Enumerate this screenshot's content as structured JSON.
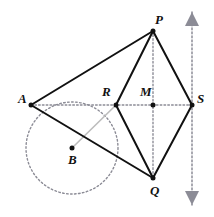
{
  "figure": {
    "kind": "geometry-diagram",
    "width": 214,
    "height": 217,
    "background": "#ffffff",
    "colors": {
      "stroke_solid": "#111111",
      "stroke_dotted": "#8c8c96",
      "stroke_gray": "#bdbdbd",
      "point_fill": "#111111",
      "arrow_fill": "#8c8c96",
      "label_color": "#111111"
    },
    "points": [
      {
        "id": "A",
        "label": "A",
        "x": 31,
        "y": 105,
        "label_dx": -13,
        "label_dy": -13,
        "dot": true
      },
      {
        "id": "R",
        "label": "R",
        "x": 116,
        "y": 105,
        "label_dx": -14,
        "label_dy": -20,
        "dot": true
      },
      {
        "id": "M",
        "label": "M",
        "x": 153,
        "y": 105,
        "label_dx": -13,
        "label_dy": -20,
        "dot": true
      },
      {
        "id": "S",
        "label": "S",
        "x": 192,
        "y": 105,
        "label_dx": 5,
        "label_dy": -13,
        "dot": true
      },
      {
        "id": "P",
        "label": "P",
        "x": 153,
        "y": 31,
        "label_dx": 2,
        "label_dy": -18,
        "dot": true
      },
      {
        "id": "Q",
        "label": "Q",
        "x": 153,
        "y": 178,
        "label_dx": -3,
        "label_dy": 6,
        "dot": true
      },
      {
        "id": "B",
        "label": "B",
        "x": 72,
        "y": 148,
        "label_dx": -4,
        "label_dy": 5,
        "dot": true
      }
    ],
    "solid_segments": [
      {
        "name": "segment-A-P",
        "from": "A",
        "to": "P"
      },
      {
        "name": "segment-P-R",
        "from": "P",
        "to": "R"
      },
      {
        "name": "segment-P-S",
        "from": "P",
        "to": "S"
      },
      {
        "name": "segment-S-Q",
        "from": "S",
        "to": "Q"
      },
      {
        "name": "segment-R-Q",
        "from": "R",
        "to": "Q"
      },
      {
        "name": "segment-A-Q",
        "from": "A",
        "to": "Q"
      }
    ],
    "gray_segments": [
      {
        "name": "segment-R-B",
        "from": "R",
        "to": "B"
      }
    ],
    "dotted_segments": [
      {
        "name": "axis-horizontal-A-S",
        "x1": 31,
        "y1": 105,
        "x2": 192,
        "y2": 105
      },
      {
        "name": "axis-vertical-P-Q",
        "x1": 153,
        "y1": 31,
        "x2": 153,
        "y2": 178
      }
    ],
    "dotted_arrow_line": {
      "name": "vertical-double-arrow-axis",
      "x": 192,
      "y_top": 12,
      "y_bottom": 205,
      "arrow_half_width": 7,
      "arrow_length": 14
    },
    "circle": {
      "name": "circle-centered-at-B",
      "center": "B",
      "cx": 72,
      "cy": 148,
      "r": 46,
      "style": "dotted"
    }
  }
}
